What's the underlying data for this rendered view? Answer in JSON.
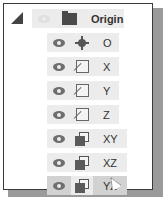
{
  "tree": {
    "parent": {
      "label": "Origin",
      "icon": "folder-icon",
      "visibility_icon": "eye-hidden-icon",
      "expanded": true
    },
    "children": [
      {
        "label": "O",
        "icon": "point-icon",
        "visibility_icon": "eye-icon"
      },
      {
        "label": "X",
        "icon": "axis-icon",
        "visibility_icon": "eye-icon"
      },
      {
        "label": "Y",
        "icon": "axis-icon",
        "visibility_icon": "eye-icon"
      },
      {
        "label": "Z",
        "icon": "axis-icon",
        "visibility_icon": "eye-icon"
      },
      {
        "label": "XY",
        "icon": "plane-icon",
        "visibility_icon": "eye-icon"
      },
      {
        "label": "XZ",
        "icon": "plane-icon",
        "visibility_icon": "eye-icon"
      },
      {
        "label": "YZ",
        "icon": "plane-icon",
        "visibility_icon": "eye-icon",
        "hovered": true
      }
    ]
  },
  "colors": {
    "row_bg": "#ececec",
    "row_hover_bg": "#d2d2d2",
    "border": "#3a3a3a",
    "shadow": "#9a9a9a"
  }
}
